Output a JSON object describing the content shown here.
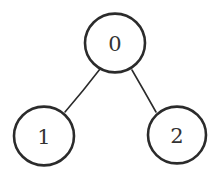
{
  "diagram": {
    "type": "tree",
    "background_color": "#ffffff",
    "stroke_color": "#2b2b2b",
    "label_color": "#333333",
    "node_fill": "#ffffff",
    "node_stroke_width": 2.6,
    "edge_stroke_width": 1.6,
    "canvas": {
      "width": 218,
      "height": 184
    },
    "nodes": [
      {
        "id": "0",
        "label": "0",
        "role": "root",
        "cx": 115,
        "cy": 43,
        "r": 30
      },
      {
        "id": "1",
        "label": "1",
        "role": "left-child",
        "cx": 44,
        "cy": 136,
        "r": 30
      },
      {
        "id": "2",
        "label": "2",
        "role": "right-child",
        "cx": 177,
        "cy": 135,
        "r": 29
      }
    ],
    "edges": [
      {
        "id": "edge-0-1",
        "from": "0",
        "to": "1",
        "x1": 100,
        "y1": 69,
        "x2": 65,
        "y2": 112
      },
      {
        "id": "edge-0-2",
        "from": "0",
        "to": "2",
        "x1": 132,
        "y1": 70,
        "x2": 156,
        "y2": 112
      }
    ]
  }
}
